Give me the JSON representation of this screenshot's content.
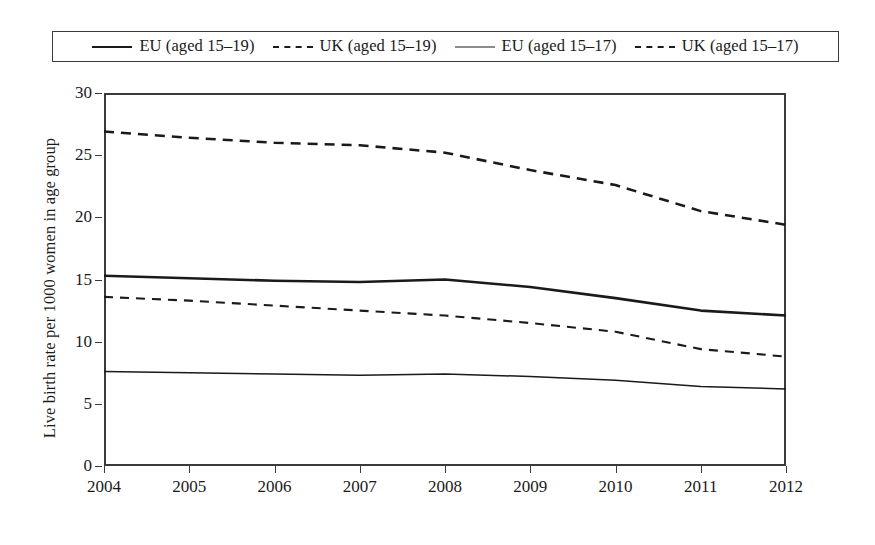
{
  "chart_data": {
    "type": "line",
    "title": "",
    "xlabel": "",
    "ylabel": "Live birth rate per 1000 women in age group",
    "x": [
      2004,
      2005,
      2006,
      2007,
      2008,
      2009,
      2010,
      2011,
      2012
    ],
    "xticklabels": [
      "2004",
      "2005",
      "2006",
      "2007",
      "2008",
      "2009",
      "2010",
      "2011",
      "2012"
    ],
    "yticklabels": [
      "0",
      "5",
      "10",
      "15",
      "20",
      "25",
      "30"
    ],
    "yticks": [
      0,
      5,
      10,
      15,
      20,
      25,
      30
    ],
    "xlim": [
      2004,
      2012
    ],
    "ylim": [
      0,
      30
    ],
    "grid": false,
    "legend_position": "top",
    "series": [
      {
        "name": "EU (aged 15–19)",
        "style": "solid-thick",
        "values": [
          15.3,
          15.1,
          14.9,
          14.8,
          15.0,
          14.4,
          13.5,
          12.5,
          12.1
        ]
      },
      {
        "name": "UK (aged 15–19)",
        "style": "dashed-thick",
        "values": [
          26.9,
          26.4,
          26.0,
          25.8,
          25.2,
          23.8,
          22.6,
          20.5,
          19.4
        ]
      },
      {
        "name": "EU (aged 15–17)",
        "style": "solid-thin",
        "values": [
          7.6,
          7.5,
          7.4,
          7.3,
          7.4,
          7.2,
          6.9,
          6.4,
          6.2
        ]
      },
      {
        "name": "UK (aged 15–17)",
        "style": "dashed-thin",
        "values": [
          13.6,
          13.3,
          12.9,
          12.5,
          12.1,
          11.5,
          10.8,
          9.4,
          8.8
        ]
      }
    ]
  },
  "legend": {
    "entries": [
      {
        "label": "EU (aged 15–19)",
        "style": "solid-thick"
      },
      {
        "label": "UK (aged 15–19)",
        "style": "dashed-thick"
      },
      {
        "label": "EU (aged 15–17)",
        "style": "solid-thin"
      },
      {
        "label": "UK (aged 15–17)",
        "style": "dashed-thin"
      }
    ]
  },
  "colors": {
    "line": "#1a1a1a",
    "axis": "#3a3a3a",
    "background": "#ffffff"
  }
}
